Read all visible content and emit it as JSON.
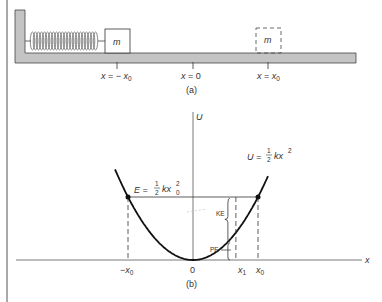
{
  "figure": {
    "panel_a": {
      "caption": "(a)",
      "mass_label": "m",
      "ghost_mass_label": "m",
      "positions": [
        {
          "var": "x",
          "eq": " = − ",
          "sub": "x",
          "subscript": "0"
        },
        {
          "var": "x",
          "eq": " = 0",
          "sub": "",
          "subscript": ""
        },
        {
          "var": "x",
          "eq": " = ",
          "sub": "x",
          "subscript": "0"
        }
      ]
    },
    "panel_b": {
      "caption": "(b)",
      "y_axis_label": "U",
      "x_axis_label": "x",
      "energy_label": {
        "lhs": "E = ",
        "frac_num": "1",
        "frac_den": "2",
        "rhs": "kx",
        "sub": "0",
        "sup": "2"
      },
      "curve_label": {
        "lhs": "U = ",
        "frac_num": "1",
        "frac_den": "2",
        "rhs": "kx",
        "sup": "2"
      },
      "ke_label": "KE",
      "pe_label": "PE",
      "ticks": [
        {
          "text": "−x",
          "sub": "0"
        },
        {
          "text": "0",
          "sub": ""
        },
        {
          "text": "x",
          "sub": "1"
        },
        {
          "text": "x",
          "sub": "0"
        }
      ],
      "x1_over_x0": 0.6
    },
    "colors": {
      "ink": "#222222",
      "floor": "#bdbdbd",
      "wall": "#c4c4c4"
    }
  }
}
